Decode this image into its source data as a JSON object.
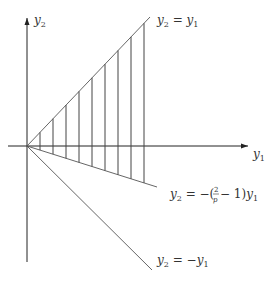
{
  "diagram": {
    "colors": {
      "line": "#555555",
      "axis": "#222222",
      "text": "#333333"
    },
    "axes": {
      "x_label": "y",
      "x_label_sub": "1",
      "y_label": "y",
      "y_label_sub": "2"
    },
    "lines": {
      "upper": {
        "label_lhs": "y",
        "lhs_sub": "2",
        "eq": " = ",
        "rhs": "y",
        "rhs_sub": "1",
        "equation": "y2 = y1"
      },
      "middle": {
        "label_lhs": "y",
        "lhs_sub": "2",
        "eq": " = −(",
        "frac_num": "2",
        "frac_den": "p",
        "tail": " − 1)",
        "rhs": "y",
        "rhs_sub": "1",
        "equation": "y2 = −(2/p − 1)y1"
      },
      "lower": {
        "label_lhs": "y",
        "lhs_sub": "2",
        "eq": " = −",
        "rhs": "y",
        "rhs_sub": "1",
        "equation": "y2 = −y1"
      }
    },
    "hatch_count": 9,
    "hatched_region": "between y2 = y1 and y2 = −(2/p − 1)y1"
  }
}
